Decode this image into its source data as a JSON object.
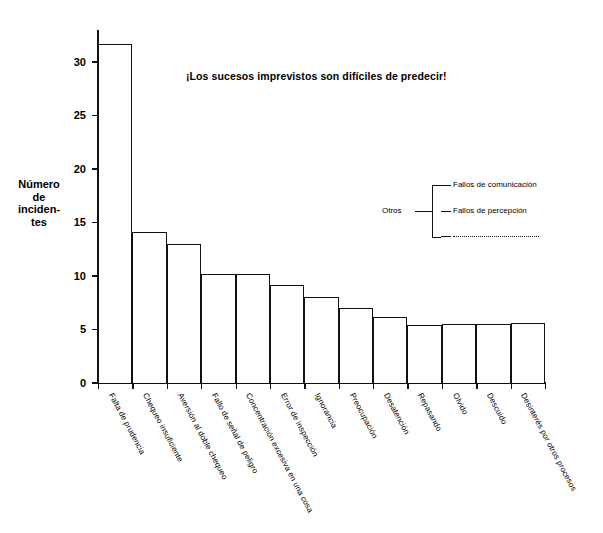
{
  "chart_data": {
    "type": "bar",
    "title": "¡Los sucesos imprevistos son difíciles de predecir!",
    "xlabel": "",
    "ylabel": "Número de incidentes",
    "ylim": [
      0,
      33
    ],
    "yticks": [
      0,
      5,
      10,
      15,
      20,
      25,
      30
    ],
    "grid": false,
    "legend_position": "inside-right",
    "categories": [
      "Falta de prudencia",
      "Chequeo insuficiente",
      "Aversión al doble chequeo",
      "Fallo de señal de peligro",
      "Concentración excesiva en una cosa",
      "Error de inspección",
      "Ignorancia",
      "Preocupación",
      "Desatención",
      "Repasando",
      "Olvido",
      "Descuido",
      "Desinterés por otros procesos"
    ],
    "values": [
      31.7,
      14.1,
      13.0,
      10.2,
      10.2,
      9.2,
      8.0,
      7.0,
      6.2,
      5.4,
      5.5,
      5.5,
      5.6
    ]
  },
  "yaxis": {
    "title_lines": [
      "Número",
      "de",
      "inciden-",
      "tes"
    ],
    "tick_labels": [
      "0",
      "5",
      "10",
      "15",
      "20",
      "25",
      "30"
    ]
  },
  "legend": {
    "group_label": "Otros",
    "entries": [
      "Fallos de comunicación",
      "Fallos de percepción",
      ""
    ]
  }
}
